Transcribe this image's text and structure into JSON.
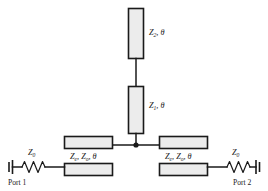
{
  "diagram": {
    "background_color": "#ffffff",
    "line_color": "#1a1a1a",
    "box_fill_color": "#ececec",
    "width": 268,
    "height": 191
  },
  "stubs": {
    "upper": {
      "name": "open-stub-z2",
      "impedance": "Z",
      "impedance_sub": "2",
      "separator": ", ",
      "electrical_length": "θ",
      "label_full": "Z2, θ"
    },
    "lower": {
      "name": "series-stub-z1",
      "impedance": "Z",
      "impedance_sub": "1",
      "separator": ", ",
      "electrical_length": "θ",
      "label_full": "Z1, θ"
    }
  },
  "coupled_lines": {
    "left": {
      "name": "coupled-line-left",
      "even_mode": "Z",
      "even_sub": "e",
      "odd_mode": "Z",
      "odd_sub": "o",
      "electrical_length": "θ",
      "label_full": "Ze, Zo, θ"
    },
    "right": {
      "name": "coupled-line-right",
      "even_mode": "Z",
      "even_sub": "e",
      "odd_mode": "Z",
      "odd_sub": "o",
      "electrical_length": "θ",
      "label_full": "Ze, Zo, θ"
    }
  },
  "ports": {
    "left": {
      "name": "port-1",
      "label": "Port 1",
      "source_impedance": "Z",
      "source_impedance_sub": "0",
      "source_impedance_full": "Z0"
    },
    "right": {
      "name": "port-2",
      "label": "Port 2",
      "source_impedance": "Z",
      "source_impedance_sub": "0",
      "source_impedance_full": "Z0"
    }
  }
}
